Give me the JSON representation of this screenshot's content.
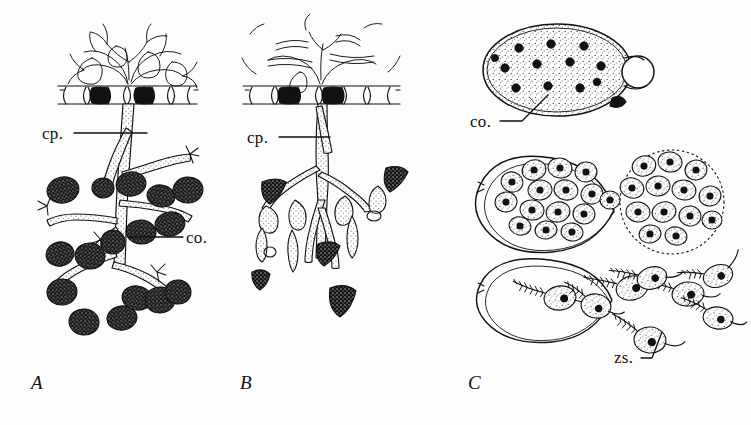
{
  "figure": {
    "background_color": "#fdfdfd",
    "ink_color": "#111111"
  },
  "panels": [
    {
      "id": "A",
      "letter": "A",
      "letter_x": 31,
      "letter_y": 381,
      "style": "dichotomously branched conidiophore with rounded dark conidia"
    },
    {
      "id": "B",
      "letter": "B",
      "letter_x": 240,
      "letter_y": 381,
      "style": "conidiophore with elongate swollen branches and pointed dark conidia"
    },
    {
      "id": "C",
      "letter": "C",
      "letter_x": 468,
      "letter_y": 381,
      "style": "three stages of conidium germination and zoospore release"
    }
  ],
  "labels": [
    {
      "id": "cp-a",
      "text": "cp.",
      "x": 42,
      "y": 126,
      "leader_to_x": 147,
      "leader_to_y": 135
    },
    {
      "id": "co-a",
      "text": "co.",
      "x": 186,
      "y": 233,
      "leader_to_x": 128,
      "leader_to_y": 238
    },
    {
      "id": "cp-b",
      "text": "cp.",
      "x": 247,
      "y": 130,
      "leader_to_x": 330,
      "leader_to_y": 139
    },
    {
      "id": "co-c",
      "text": "co.",
      "x": 470,
      "y": 124,
      "leader_to_x": 548,
      "leader_to_y": 95
    },
    {
      "id": "zs-c",
      "text": "zs.",
      "x": 614,
      "y": 358,
      "leader_to_x": 662,
      "leader_to_y": 330
    }
  ],
  "legend_terms": [
    {
      "abbr": "cp.",
      "meaning": "conidiophore"
    },
    {
      "abbr": "co.",
      "meaning": "conidium"
    },
    {
      "abbr": "zs.",
      "meaning": "zoospore"
    }
  ],
  "panel_c_stages": [
    {
      "order": 1,
      "name": "conidium-with-nuclei",
      "nuclei_count": 12,
      "has_papilla": true
    },
    {
      "order": 2,
      "name": "cleaved-protoplasm-in-vesicle",
      "zoospore_count": 32,
      "has_vesicle": true
    },
    {
      "order": 3,
      "name": "released-zoospores",
      "zoospore_count": 8,
      "flagella_per_spore": 2
    }
  ]
}
